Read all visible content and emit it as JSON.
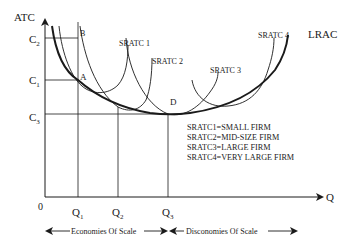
{
  "diagram": {
    "axes": {
      "y_label": "ATC",
      "x_label": "Q",
      "origin_label": "0"
    },
    "y_ticks": [
      {
        "label": "C",
        "sub": "2"
      },
      {
        "label": "C",
        "sub": "1"
      },
      {
        "label": "C",
        "sub": "3"
      }
    ],
    "x_ticks": [
      {
        "label": "Q",
        "sub": "1"
      },
      {
        "label": "Q",
        "sub": "2"
      },
      {
        "label": "Q",
        "sub": "3"
      }
    ],
    "points": {
      "a": "A",
      "b": "B",
      "d": "D"
    },
    "curves": {
      "lrac": "LRAC",
      "sratc1": "SRATC 1",
      "sratc2": "SRATC 2",
      "sratc3": "SRATC 3",
      "sratc4": "SRATC 4"
    },
    "legend": [
      "SRATC1=SMALL FIRM",
      "SRATC2=MID-SIZE FIRM",
      "SRATC3=LARGE FIRM",
      "SRATC4=VERY LARGE FIRM"
    ],
    "regions": {
      "economies": "Economies Of Scale",
      "diseconomies": "Disconomies Of Scale"
    },
    "colors": {
      "ink": "#1a1a1a",
      "background": "#ffffff"
    }
  }
}
